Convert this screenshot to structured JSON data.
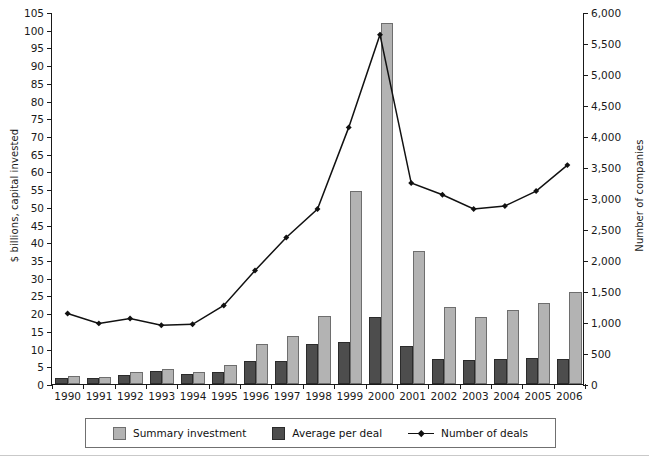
{
  "chart_data": {
    "type": "bar",
    "title": "",
    "xlabel": "",
    "ylabel": "$ billions, capital invested",
    "ylabel_right": "Number of companies",
    "grid": false,
    "legend_position": "bottom",
    "categories": [
      "1990",
      "1991",
      "1992",
      "1993",
      "1994",
      "1995",
      "1996",
      "1997",
      "1998",
      "1999",
      "2000",
      "2001",
      "2002",
      "2003",
      "2004",
      "2005",
      "2006"
    ],
    "ylim": [
      0,
      105
    ],
    "ylim_right": [
      0,
      6000
    ],
    "yticks": [
      "0",
      "5",
      "10",
      "15",
      "20",
      "25",
      "30",
      "35",
      "40",
      "45",
      "50",
      "55",
      "60",
      "65",
      "70",
      "75",
      "80",
      "85",
      "90",
      "95",
      "100",
      "105"
    ],
    "yticks_right": [
      "0",
      "500",
      "1,000",
      "1,500",
      "2,000",
      "2,500",
      "3,000",
      "3,500",
      "4,000",
      "4,500",
      "5,000",
      "5,500",
      "6,000"
    ],
    "series": [
      {
        "name": "Summary investment",
        "kind": "bar",
        "axis": "left",
        "color": "#b3b3b3",
        "values": [
          2.4,
          2.0,
          3.3,
          4.3,
          3.4,
          5.5,
          11.2,
          13.6,
          19.2,
          54.5,
          102.0,
          37.5,
          21.6,
          19.0,
          21.0,
          22.9,
          26.1
        ]
      },
      {
        "name": "Average per deal",
        "kind": "bar",
        "axis": "left",
        "color": "#4d4d4d",
        "values": [
          1.6,
          1.7,
          2.6,
          3.8,
          2.9,
          3.4,
          6.5,
          6.4,
          11.3,
          11.8,
          19.0,
          10.7,
          7.1,
          6.7,
          7.2,
          7.3,
          7.2
        ]
      },
      {
        "name": "Number of deals",
        "kind": "line",
        "axis": "right",
        "color": "#111111",
        "values": [
          1140,
          980,
          1060,
          950,
          965,
          1270,
          1835,
          2370,
          2830,
          4150,
          5650,
          3250,
          3060,
          2830,
          2880,
          3120,
          3540
        ]
      }
    ]
  },
  "axes": {
    "left_title": "$ billions, capital invested",
    "right_title": "Number of companies"
  },
  "legend": {
    "items": [
      {
        "label": "Summary investment",
        "marker": "swatch-light"
      },
      {
        "label": "Average per deal",
        "marker": "swatch-dark"
      },
      {
        "label": "Number of deals",
        "marker": "line-marker"
      }
    ]
  }
}
